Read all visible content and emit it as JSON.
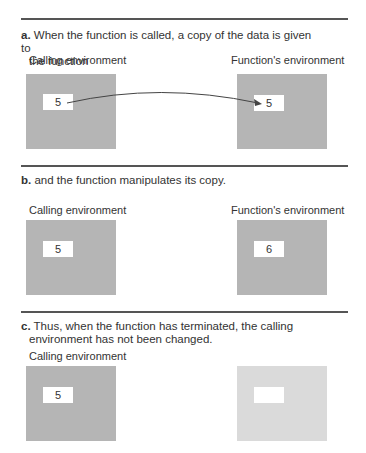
{
  "panels": [
    {
      "label": "a.",
      "caption_line1": "When the function is called, a copy of the data is given to",
      "caption_line2": "the function",
      "left": {
        "title": "Calling environment",
        "value": "5"
      },
      "right": {
        "title": "Function's environment",
        "value": "5"
      },
      "arrow": "copy-arrow"
    },
    {
      "label": "b.",
      "caption_line1": "and the function manipulates its copy.",
      "left": {
        "title": "Calling environment",
        "value": "5"
      },
      "right": {
        "title": "Function's environment",
        "value": "6"
      }
    },
    {
      "label": "c.",
      "caption_line1": "Thus, when the function has terminated, the calling",
      "caption_line2": "environment has not been changed.",
      "left": {
        "title": "Calling environment",
        "value": "5"
      },
      "right": {
        "title": "",
        "value": ""
      }
    }
  ],
  "colors": {
    "environment_box": "#b5b5b5",
    "terminated_environment_box": "#dadada",
    "cell": "#ffffff",
    "rule": "#555555"
  }
}
